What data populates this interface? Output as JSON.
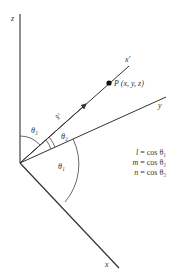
{
  "figure": {
    "axes": {
      "z_label": "z",
      "y_label": "y",
      "x_label": "x",
      "xprime_label": "x′",
      "unit_vector_label": "x̂′"
    },
    "point": {
      "label": "P (x, y, z)"
    },
    "angles": {
      "theta1": "θ₁",
      "theta2": "θ₂",
      "theta3": "θ₃"
    },
    "equations": [
      {
        "lhs": "l",
        "rhs": "= cos θ₁"
      },
      {
        "lhs": "m",
        "rhs": "= cos θ₂"
      },
      {
        "lhs": "n",
        "rhs": "= cos θ₃"
      }
    ],
    "colors": {
      "line": "#333333",
      "background": "#ffffff"
    }
  }
}
